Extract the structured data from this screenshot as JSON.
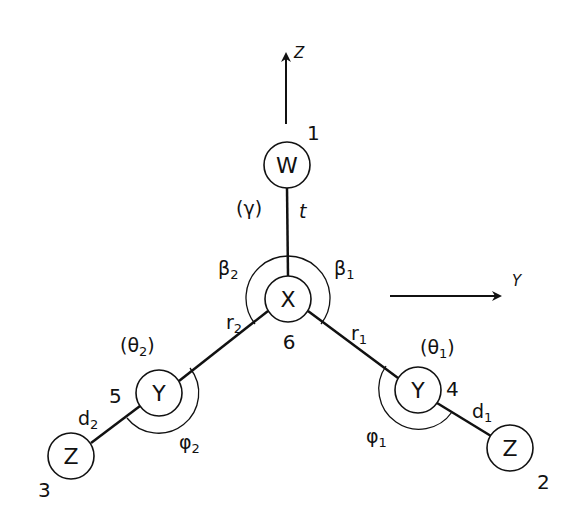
{
  "diagram": {
    "type": "molecular-geometry",
    "axes": {
      "z": {
        "label": "Z"
      },
      "y": {
        "label": "Y"
      }
    },
    "atoms": [
      {
        "id": "W",
        "symbol": "W",
        "index": "1"
      },
      {
        "id": "X",
        "symbol": "X",
        "index": "6"
      },
      {
        "id": "Y1",
        "symbol": "Y",
        "index": "4"
      },
      {
        "id": "Y2",
        "symbol": "Y",
        "index": "5"
      },
      {
        "id": "Z2",
        "symbol": "Z",
        "index": "2"
      },
      {
        "id": "Z3",
        "symbol": "Z",
        "index": "3"
      }
    ],
    "bonds": {
      "t": {
        "main": "t",
        "sub": ""
      },
      "r1": {
        "main": "r",
        "sub": "1"
      },
      "r2": {
        "main": "r",
        "sub": "2"
      },
      "d1": {
        "main": "d",
        "sub": "1"
      },
      "d2": {
        "main": "d",
        "sub": "2"
      }
    },
    "angles": {
      "beta1": {
        "main": "β",
        "sub": "1"
      },
      "beta2": {
        "main": "β",
        "sub": "2"
      },
      "phi1": {
        "main": "φ",
        "sub": "1"
      },
      "phi2": {
        "main": "φ",
        "sub": "2"
      }
    },
    "torsions": {
      "gamma": {
        "open": "(",
        "main": "γ",
        "sub": "",
        "close": ")"
      },
      "theta1": {
        "open": "(",
        "main": "θ",
        "sub": "1",
        "close": ")"
      },
      "theta2": {
        "open": "(",
        "main": "θ",
        "sub": "2",
        "close": ")"
      }
    }
  }
}
